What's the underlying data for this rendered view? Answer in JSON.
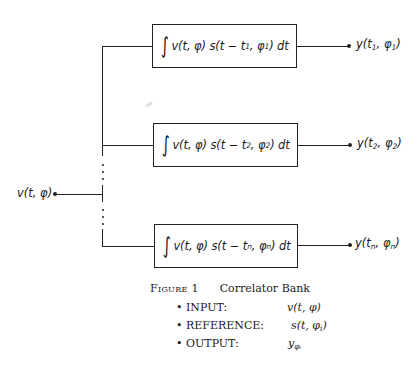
{
  "diagram": {
    "input": {
      "label": "v(t, φ)"
    },
    "correlators": [
      {
        "formula_prefix": "v(t, φ) s(t − t",
        "sub_t": "1",
        "formula_mid": ", φ",
        "sub_phi": "1",
        "formula_suffix": ") dt",
        "output_prefix": "y(t",
        "output_sub_t": "1",
        "output_mid": ", φ",
        "output_sub_phi": "1",
        "output_suffix": ")"
      },
      {
        "formula_prefix": "v(t, φ) s(t − t",
        "sub_t": "2",
        "formula_mid": ", φ",
        "sub_phi": "2",
        "formula_suffix": ") dt",
        "output_prefix": "y(t",
        "output_sub_t": "2",
        "output_mid": ", φ",
        "output_sub_phi": "2",
        "output_suffix": ")"
      },
      {
        "formula_prefix": "v(t, φ) s(t − t",
        "sub_t": "n",
        "formula_mid": ", φ",
        "sub_phi": "n",
        "formula_suffix": ") dt",
        "output_prefix": "y(t",
        "output_sub_t": "n",
        "output_mid": ", φ",
        "output_sub_phi": "n",
        "output_suffix": ")"
      }
    ],
    "integral_symbol": "∫"
  },
  "caption": {
    "figure_label": "Figure 1",
    "title": "Correlator Bank",
    "items": [
      {
        "bullet": "•",
        "label": "INPUT:",
        "value": "v(t, φ)"
      },
      {
        "bullet": "•",
        "label": "REFERENCE:",
        "value_prefix": "s(t, φ",
        "value_sub": "i",
        "value_suffix": ")"
      },
      {
        "bullet": "•",
        "label": "OUTPUT:",
        "value_prefix": "y",
        "value_sub": "φᵢ"
      }
    ]
  }
}
